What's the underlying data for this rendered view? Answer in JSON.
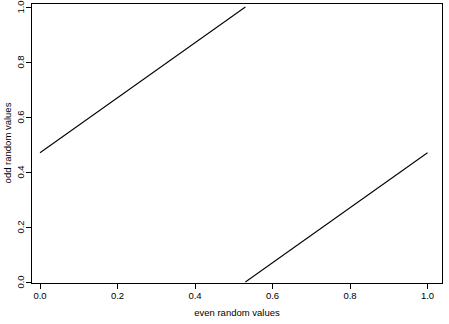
{
  "chart_data": {
    "type": "line",
    "title": "",
    "subtitle": "",
    "xlabel": "even random values",
    "ylabel": "odd random values",
    "xlim": [
      -0.038,
      1.038
    ],
    "ylim": [
      -0.038,
      1.038
    ],
    "xticks": [
      0.0,
      0.2,
      0.4,
      0.6,
      0.8,
      1.0
    ],
    "yticks": [
      0.0,
      0.2,
      0.4,
      0.6,
      0.8,
      1.0
    ],
    "xtick_labels": [
      "0.0",
      "0.2",
      "0.4",
      "0.6",
      "0.8",
      "1.0"
    ],
    "ytick_labels": [
      "0.0",
      "0.2",
      "0.4",
      "0.6",
      "0.8",
      "1.0"
    ],
    "grid": false,
    "legend": false,
    "legend_position": "none",
    "frame": true,
    "line_color": "#000000",
    "background_color": "#ffffff",
    "series": [
      {
        "name": "segment-upper",
        "x": [
          0.0,
          0.53
        ],
        "y": [
          0.47,
          1.0
        ]
      },
      {
        "name": "segment-lower",
        "x": [
          0.53,
          1.0
        ],
        "y": [
          0.0,
          0.47
        ]
      }
    ]
  },
  "axes": {
    "x_title": "even random values",
    "y_title": "odd random values",
    "x_tick_labels": [
      "0.0",
      "0.2",
      "0.4",
      "0.6",
      "0.8",
      "1.0"
    ],
    "y_tick_labels": [
      "0.0",
      "0.2",
      "0.4",
      "0.6",
      "0.8",
      "1.0"
    ]
  }
}
